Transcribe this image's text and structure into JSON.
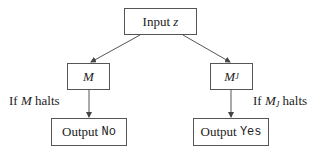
{
  "diagram": {
    "nodes": {
      "input": {
        "prefix": "Input",
        "var": "z"
      },
      "m": {
        "var": "M"
      },
      "mj": {
        "var": "M",
        "sub": "J"
      },
      "output_no": {
        "prefix": "Output",
        "value": "No"
      },
      "output_yes": {
        "prefix": "Output",
        "value": "Yes"
      }
    },
    "edge_labels": {
      "left": {
        "pre": "If",
        "var": "M",
        "post": "halts"
      },
      "right": {
        "pre": "If",
        "var": "M",
        "sub": "J",
        "post": "halts"
      }
    },
    "edges": [
      {
        "from": "input",
        "to": "m"
      },
      {
        "from": "input",
        "to": "mj"
      },
      {
        "from": "m",
        "to": "output_no",
        "label": "left"
      },
      {
        "from": "mj",
        "to": "output_yes",
        "label": "right"
      }
    ],
    "colors": {
      "stroke": "#555555",
      "text": "#222222",
      "background": "#ffffff"
    }
  }
}
